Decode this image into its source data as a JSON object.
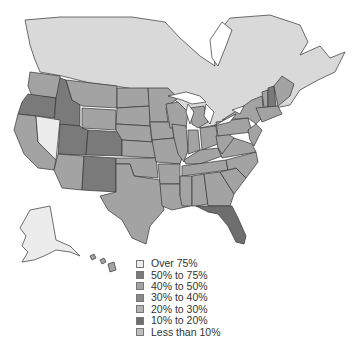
{
  "map": {
    "type": "choropleth",
    "region": "United States and southern Canada",
    "colors": {
      "over_75": "#ececec",
      "50_75": "#7a7a7a",
      "40_50": "#a3a3a3",
      "30_40": "#8a8a8a",
      "20_30": "#b2b2b2",
      "10_20": "#6e6e6e",
      "less_10": "#bdbdbd",
      "canada": "#d9d9d9",
      "water": "#ffffff"
    },
    "highlighted_states": {
      "Nevada": "Over 75%",
      "Oregon": "30% to 40%",
      "Idaho": "30% to 40%",
      "Utah": "30% to 40%",
      "Colorado": "30% to 40%",
      "New Mexico": "30% to 40%",
      "Florida": "10% to 20%",
      "New Hampshire": "30% to 40%",
      "Alaska": "Over 75%"
    }
  },
  "legend": {
    "items": [
      {
        "label": "Over 75%",
        "color": "#ececec"
      },
      {
        "label": "50% to 75%",
        "color": "#7a7a7a"
      },
      {
        "label": "40% to 50%",
        "color": "#a3a3a3"
      },
      {
        "label": "30% to 40%",
        "color": "#8a8a8a"
      },
      {
        "label": "20% to 30%",
        "color": "#b2b2b2"
      },
      {
        "label": "10% to 20%",
        "color": "#6e6e6e"
      },
      {
        "label": "Less than 10%",
        "color": "#bdbdbd"
      }
    ]
  }
}
